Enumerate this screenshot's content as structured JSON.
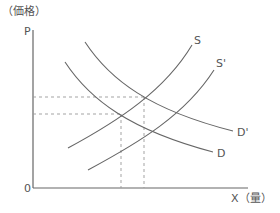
{
  "diagram": {
    "type": "supply-demand",
    "y_axis_label": "（価格）",
    "y_axis_symbol": "P",
    "x_axis_symbol": "X",
    "x_axis_label": "（量）",
    "origin_label": "0",
    "curves": [
      {
        "name": "S",
        "label": "S",
        "kind": "supply"
      },
      {
        "name": "S'",
        "label": "S'",
        "kind": "supply"
      },
      {
        "name": "D",
        "label": "D",
        "kind": "demand"
      },
      {
        "name": "D'",
        "label": "D'",
        "kind": "demand"
      }
    ],
    "equilibria": [
      {
        "curves": [
          "S",
          "D'"
        ],
        "marked_with_dashed_lines": true
      },
      {
        "curves": [
          "S",
          "D"
        ],
        "marked_with_dashed_lines": true
      }
    ],
    "colors": {
      "axis": "#666666",
      "curve": "#666666",
      "dashed": "#999999",
      "text": "#555555"
    }
  }
}
